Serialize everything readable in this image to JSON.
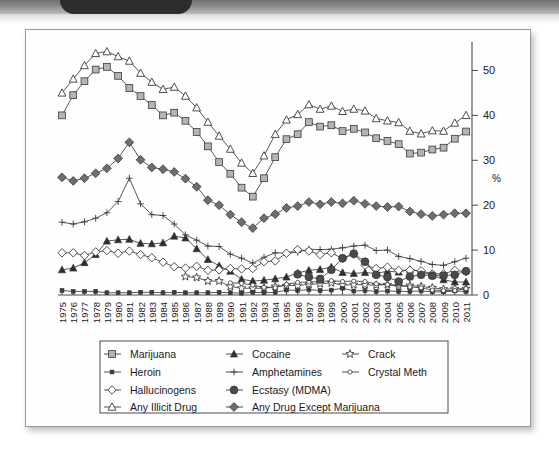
{
  "header": {
    "tab_name": "dark-tab",
    "band_color": "#8b8d8f",
    "tab_color": "#2b2d2f"
  },
  "chart_data": {
    "type": "line",
    "title": "",
    "xlabel": "",
    "ylabel": "%",
    "ylim": [
      0,
      55
    ],
    "yticks": [
      0,
      10,
      20,
      30,
      40,
      50
    ],
    "grid": false,
    "legend_position": "bottom",
    "x": [
      1975,
      1976,
      1977,
      1978,
      1979,
      1980,
      1981,
      1982,
      1983,
      1984,
      1985,
      1986,
      1987,
      1988,
      1989,
      1990,
      1991,
      1992,
      1993,
      1994,
      1995,
      1996,
      1997,
      1998,
      1999,
      2000,
      2001,
      2002,
      2003,
      2004,
      2005,
      2006,
      2007,
      2008,
      2009,
      2010,
      2011
    ],
    "categories": [
      "1975",
      "1976",
      "1977",
      "1978",
      "1979",
      "1980",
      "1981",
      "1982",
      "1983",
      "1984",
      "1985",
      "1986",
      "1987",
      "1988",
      "1989",
      "1990",
      "1991",
      "1992",
      "1993",
      "1994",
      "1995",
      "1996",
      "1997",
      "1998",
      "1999",
      "2000",
      "2001",
      "2002",
      "2003",
      "2004",
      "2005",
      "2006",
      "2007",
      "2008",
      "2009",
      "2010",
      "2011"
    ],
    "series": [
      {
        "name": "Marijuana",
        "marker": "square-filled-gray",
        "values": [
          40.0,
          44.5,
          47.6,
          50.2,
          50.8,
          48.8,
          46.1,
          44.3,
          42.3,
          40.0,
          40.6,
          38.8,
          36.3,
          33.1,
          29.6,
          27.0,
          23.9,
          21.9,
          26.0,
          30.7,
          34.7,
          35.8,
          38.5,
          37.5,
          37.8,
          36.5,
          37.0,
          36.2,
          34.9,
          34.3,
          33.6,
          31.5,
          31.7,
          32.4,
          32.8,
          34.8,
          36.4
        ]
      },
      {
        "name": "Cocaine",
        "marker": "triangle-filled",
        "values": [
          5.6,
          6.0,
          7.2,
          9.0,
          12.0,
          12.3,
          12.4,
          11.5,
          11.4,
          11.6,
          13.1,
          12.7,
          10.3,
          7.9,
          6.5,
          5.3,
          3.5,
          3.1,
          3.3,
          3.6,
          4.0,
          4.9,
          5.5,
          5.7,
          6.2,
          5.0,
          4.8,
          5.0,
          4.8,
          5.3,
          5.1,
          5.7,
          5.2,
          4.4,
          3.4,
          2.9,
          2.9
        ]
      },
      {
        "name": "Crack",
        "marker": "star-open",
        "values": [
          null,
          null,
          null,
          null,
          null,
          null,
          null,
          null,
          null,
          null,
          null,
          4.1,
          3.9,
          3.1,
          3.1,
          1.9,
          1.5,
          1.5,
          1.5,
          1.9,
          2.1,
          2.1,
          2.4,
          2.5,
          2.7,
          2.2,
          2.3,
          2.3,
          2.2,
          2.3,
          1.9,
          2.1,
          1.9,
          1.6,
          1.3,
          1.4,
          1.4
        ]
      },
      {
        "name": "Heroin",
        "marker": "square-small-filled",
        "values": [
          1.0,
          0.8,
          0.8,
          0.8,
          0.5,
          0.5,
          0.5,
          0.6,
          0.6,
          0.5,
          0.6,
          0.5,
          0.5,
          0.5,
          0.6,
          0.5,
          0.4,
          0.6,
          0.5,
          0.6,
          1.1,
          1.0,
          1.2,
          1.0,
          1.1,
          1.5,
          0.9,
          1.0,
          0.8,
          0.9,
          0.8,
          0.8,
          0.9,
          0.7,
          0.7,
          0.9,
          0.8
        ]
      },
      {
        "name": "Amphetamines",
        "marker": "plus",
        "values": [
          16.2,
          15.8,
          16.3,
          17.1,
          18.3,
          20.8,
          26.0,
          20.3,
          17.9,
          17.7,
          15.8,
          13.4,
          12.2,
          10.9,
          10.8,
          9.1,
          8.2,
          7.1,
          8.4,
          9.4,
          9.3,
          9.5,
          10.2,
          10.1,
          10.2,
          10.5,
          10.9,
          11.1,
          9.9,
          10.0,
          8.6,
          8.1,
          7.5,
          6.8,
          6.6,
          7.4,
          8.2
        ]
      },
      {
        "name": "Crystal Meth",
        "marker": "circle-small-open",
        "values": [
          null,
          null,
          null,
          null,
          null,
          null,
          null,
          null,
          null,
          null,
          null,
          null,
          null,
          null,
          null,
          2.7,
          2.6,
          2.2,
          1.7,
          1.6,
          2.4,
          2.8,
          2.9,
          3.0,
          3.2,
          3.0,
          3.1,
          3.0,
          2.5,
          2.3,
          2.2,
          1.8,
          1.6,
          1.1,
          1.0,
          1.0,
          1.4
        ]
      },
      {
        "name": "Hallucinogens",
        "marker": "diamond-open",
        "values": [
          9.4,
          9.4,
          8.8,
          9.6,
          9.9,
          9.3,
          9.8,
          9.0,
          8.3,
          7.3,
          6.3,
          6.0,
          6.4,
          5.5,
          5.6,
          5.9,
          5.8,
          5.9,
          7.4,
          7.6,
          9.3,
          10.1,
          9.8,
          9.0,
          9.4,
          8.1,
          9.1,
          6.6,
          5.9,
          6.2,
          5.5,
          5.5,
          5.4,
          4.7,
          4.7,
          5.5,
          5.2
        ]
      },
      {
        "name": "Ecstasy (MDMA)",
        "marker": "circle-filled",
        "values": [
          null,
          null,
          null,
          null,
          null,
          null,
          null,
          null,
          null,
          null,
          null,
          null,
          null,
          null,
          null,
          null,
          null,
          null,
          null,
          null,
          null,
          4.6,
          4.0,
          3.6,
          5.6,
          8.2,
          9.2,
          7.4,
          4.5,
          4.0,
          3.0,
          4.1,
          4.5,
          4.3,
          4.3,
          4.5,
          5.3
        ]
      },
      {
        "name": "Any Illicit Drug",
        "marker": "triangle-open",
        "values": [
          45.0,
          48.1,
          51.1,
          53.8,
          54.2,
          53.1,
          52.1,
          49.4,
          47.4,
          45.8,
          46.3,
          44.3,
          41.7,
          38.5,
          35.4,
          32.5,
          29.4,
          27.1,
          31.0,
          35.8,
          39.0,
          40.2,
          42.4,
          41.4,
          42.1,
          40.9,
          41.4,
          41.0,
          39.3,
          38.8,
          38.4,
          36.5,
          35.9,
          36.6,
          36.5,
          38.3,
          40.0
        ]
      },
      {
        "name": "Any Drug Except Marijuana",
        "marker": "diamond-filled",
        "values": [
          26.2,
          25.4,
          26.0,
          27.1,
          28.2,
          30.4,
          34.0,
          30.1,
          28.4,
          28.0,
          27.4,
          25.9,
          24.1,
          21.1,
          20.0,
          17.9,
          16.2,
          14.9,
          17.1,
          18.0,
          19.4,
          19.8,
          20.7,
          20.2,
          20.7,
          20.4,
          21.0,
          20.3,
          19.8,
          19.6,
          19.7,
          18.6,
          18.0,
          17.6,
          17.9,
          18.2,
          18.2
        ]
      }
    ],
    "legend": [
      {
        "label": "Marijuana",
        "marker": "square-filled-gray"
      },
      {
        "label": "Cocaine",
        "marker": "triangle-filled"
      },
      {
        "label": "Crack",
        "marker": "star-open"
      },
      {
        "label": "Heroin",
        "marker": "square-small-filled"
      },
      {
        "label": "Amphetamines",
        "marker": "plus"
      },
      {
        "label": "Crystal Meth",
        "marker": "circle-small-open"
      },
      {
        "label": "Hallucinogens",
        "marker": "diamond-open"
      },
      {
        "label": "Ecstasy (MDMA)",
        "marker": "circle-filled"
      },
      {
        "label": "",
        "marker": "none"
      },
      {
        "label": "Any Illicit Drug",
        "marker": "triangle-open"
      },
      {
        "label": "Any Drug Except Marijuana",
        "marker": "diamond-filled"
      },
      {
        "label": "",
        "marker": "none"
      }
    ]
  },
  "colors": {
    "line": "#3a3a3a",
    "marker_gray": "#b4b4b4",
    "marker_dark": "#555555",
    "axis": "#4a4a4a",
    "text": "#1a1a1a"
  }
}
